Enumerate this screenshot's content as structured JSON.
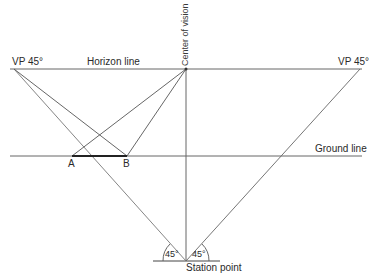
{
  "diagram": {
    "labels": {
      "vp_left": "VP 45°",
      "vp_right": "VP 45°",
      "horizon_line": "Horizon line",
      "center_of_vision": "Center of vision",
      "ground_line": "Ground line",
      "point_a": "A",
      "point_b": "B",
      "angle_left": "45°",
      "angle_right": "45°",
      "station_point": "Station point"
    },
    "colors": {
      "line": "#555555",
      "heavy_line": "#222222",
      "text": "#2a2a2a"
    }
  }
}
